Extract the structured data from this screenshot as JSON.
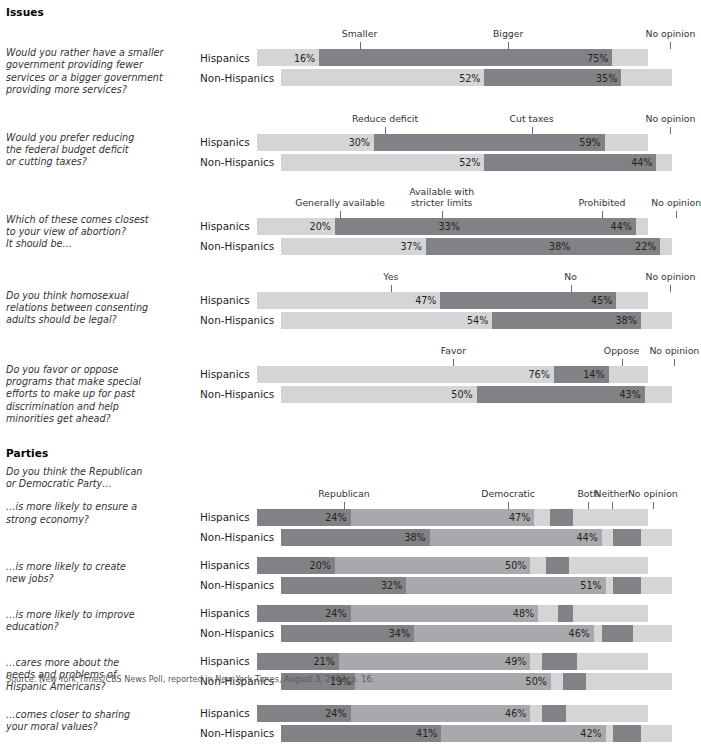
{
  "sections": [
    {
      "heading": "Issues",
      "questions": [
        {
          "id": "q-gov-size",
          "lines": [
            "Would you rather have a smaller",
            "government providing fewer",
            "services or a bigger government",
            "providing more services?"
          ],
          "categories": [
            {
              "label": "Smaller",
              "tick": 16.0
            },
            {
              "label": "Bigger",
              "tick": 54.0
            },
            {
              "label": "No opinion",
              "tick": 95.5
            }
          ],
          "rows": [
            {
              "label": "Hispanics",
              "segments": [
                {
                  "value": 16,
                  "shade": "light"
                },
                {
                  "value": 75,
                  "shade": "dark"
                },
                {
                  "value": 9,
                  "shade": "light",
                  "hide": true
                }
              ]
            },
            {
              "label": "Non-Hispanics",
              "segments": [
                {
                  "value": 52,
                  "shade": "light"
                },
                {
                  "value": 35,
                  "shade": "dark"
                },
                {
                  "value": 13,
                  "shade": "light",
                  "hide": true
                }
              ]
            }
          ]
        },
        {
          "id": "q-deficit-taxes",
          "lines": [
            "Would you prefer reducing",
            "the federal budget deficit",
            "or cutting taxes?"
          ],
          "categories": [
            {
              "label": "Reduce deficit",
              "tick": 22.5
            },
            {
              "label": "Cut taxes",
              "tick": 60.0
            },
            {
              "label": "No opinion",
              "tick": 95.5
            }
          ],
          "rows": [
            {
              "label": "Hispanics",
              "segments": [
                {
                  "value": 30,
                  "shade": "light"
                },
                {
                  "value": 59,
                  "shade": "dark"
                },
                {
                  "value": 11,
                  "shade": "light",
                  "hide": true
                }
              ]
            },
            {
              "label": "Non-Hispanics",
              "segments": [
                {
                  "value": 52,
                  "shade": "light"
                },
                {
                  "value": 44,
                  "shade": "dark"
                },
                {
                  "value": 4,
                  "shade": "light",
                  "hide": true
                }
              ]
            }
          ]
        },
        {
          "id": "q-abortion",
          "lines": [
            "Which of these comes closest",
            "to your view  of abortion?",
            "It should be…"
          ],
          "categories": [
            {
              "label": "Generally available",
              "tick": 11.0
            },
            {
              "label": "Available with\nstricter limits",
              "tick": 37.0,
              "two": true
            },
            {
              "label": "Prohibited",
              "tick": 78.0
            },
            {
              "label": "No opinion",
              "tick": 97.0
            }
          ],
          "rows": [
            {
              "label": "Hispanics",
              "segments": [
                {
                  "value": 20,
                  "shade": "light"
                },
                {
                  "value": 33,
                  "shade": "dark"
                },
                {
                  "value": 44,
                  "shade": "dark"
                },
                {
                  "value": 3,
                  "shade": "light",
                  "hide": true
                }
              ]
            },
            {
              "label": "Non-Hispanics",
              "segments": [
                {
                  "value": 37,
                  "shade": "light"
                },
                {
                  "value": 38,
                  "shade": "dark"
                },
                {
                  "value": 22,
                  "shade": "dark"
                },
                {
                  "value": 3,
                  "shade": "light",
                  "hide": true
                }
              ]
            }
          ]
        },
        {
          "id": "q-homosexual",
          "lines": [
            "Do you think homosexual",
            "relations between consenting",
            "adults should be legal?"
          ],
          "categories": [
            {
              "label": "Yes",
              "tick": 24.0
            },
            {
              "label": "No",
              "tick": 70.0
            },
            {
              "label": "No opinion",
              "tick": 95.5
            }
          ],
          "rows": [
            {
              "label": "Hispanics",
              "segments": [
                {
                  "value": 47,
                  "shade": "light"
                },
                {
                  "value": 45,
                  "shade": "dark"
                },
                {
                  "value": 8,
                  "shade": "light",
                  "hide": true
                }
              ]
            },
            {
              "label": "Non-Hispanics",
              "segments": [
                {
                  "value": 54,
                  "shade": "light"
                },
                {
                  "value": 38,
                  "shade": "dark"
                },
                {
                  "value": 8,
                  "shade": "light",
                  "hide": true
                }
              ]
            }
          ]
        },
        {
          "id": "q-affirmative-action",
          "lines": [
            "Do you favor or oppose",
            "programs that make special",
            "efforts to make up for past",
            "discrimination and help",
            "minorities get ahead?"
          ],
          "categories": [
            {
              "label": "Favor",
              "tick": 40.0
            },
            {
              "label": "Oppose",
              "tick": 83.0
            },
            {
              "label": "No opinion",
              "tick": 96.5
            }
          ],
          "rows": [
            {
              "label": "Hispanics",
              "segments": [
                {
                  "value": 76,
                  "shade": "light"
                },
                {
                  "value": 14,
                  "shade": "dark"
                },
                {
                  "value": 10,
                  "shade": "light",
                  "hide": true
                }
              ]
            },
            {
              "label": "Non-Hispanics",
              "segments": [
                {
                  "value": 50,
                  "shade": "light"
                },
                {
                  "value": 43,
                  "shade": "dark"
                },
                {
                  "value": 7,
                  "shade": "light",
                  "hide": true
                }
              ]
            }
          ]
        }
      ]
    },
    {
      "heading": "Parties",
      "intro": [
        "Do you think the Republican",
        "or Democratic Party…"
      ],
      "categories": [
        {
          "label": "Republican",
          "tick": 12.0
        },
        {
          "label": "Democratic",
          "tick": 54.0
        },
        {
          "label": "Both",
          "tick": 74.5
        },
        {
          "label": "Neither",
          "tick": 80.5
        },
        {
          "label": "No opinion",
          "tick": 91.0
        }
      ],
      "questions": [
        {
          "id": "q-strong-economy",
          "lines": [
            "…is more likely to ensure a",
            "strong economy?"
          ],
          "rows": [
            {
              "label": "Hispanics",
              "segments": [
                {
                  "value": 24,
                  "shade": "dark"
                },
                {
                  "value": 47,
                  "shade": "mid"
                },
                {
                  "value": 4,
                  "shade": "light",
                  "hide": true
                },
                {
                  "value": 6,
                  "shade": "dark",
                  "hide": true
                },
                {
                  "value": 19,
                  "shade": "light",
                  "hide": true
                }
              ]
            },
            {
              "label": "Non-Hispanics",
              "segments": [
                {
                  "value": 38,
                  "shade": "dark"
                },
                {
                  "value": 44,
                  "shade": "mid"
                },
                {
                  "value": 3,
                  "shade": "light",
                  "hide": true
                },
                {
                  "value": 7,
                  "shade": "dark",
                  "hide": true
                },
                {
                  "value": 8,
                  "shade": "light",
                  "hide": true
                }
              ]
            }
          ]
        },
        {
          "id": "q-create-jobs",
          "lines": [
            "…is more likely to create",
            "new jobs?"
          ],
          "rows": [
            {
              "label": "Hispanics",
              "segments": [
                {
                  "value": 20,
                  "shade": "dark"
                },
                {
                  "value": 50,
                  "shade": "mid"
                },
                {
                  "value": 4,
                  "shade": "light",
                  "hide": true
                },
                {
                  "value": 6,
                  "shade": "dark",
                  "hide": true
                },
                {
                  "value": 20,
                  "shade": "light",
                  "hide": true
                }
              ]
            },
            {
              "label": "Non-Hispanics",
              "segments": [
                {
                  "value": 32,
                  "shade": "dark"
                },
                {
                  "value": 51,
                  "shade": "mid"
                },
                {
                  "value": 2,
                  "shade": "light",
                  "hide": true
                },
                {
                  "value": 7,
                  "shade": "dark",
                  "hide": true
                },
                {
                  "value": 8,
                  "shade": "light",
                  "hide": true
                }
              ]
            }
          ]
        },
        {
          "id": "q-improve-education",
          "lines": [
            "…is more likely to improve",
            "education?"
          ],
          "rows": [
            {
              "label": "Hispanics",
              "segments": [
                {
                  "value": 24,
                  "shade": "dark"
                },
                {
                  "value": 48,
                  "shade": "mid"
                },
                {
                  "value": 5,
                  "shade": "light",
                  "hide": true
                },
                {
                  "value": 4,
                  "shade": "dark",
                  "hide": true
                },
                {
                  "value": 19,
                  "shade": "light",
                  "hide": true
                }
              ]
            },
            {
              "label": "Non-Hispanics",
              "segments": [
                {
                  "value": 34,
                  "shade": "dark"
                },
                {
                  "value": 46,
                  "shade": "mid"
                },
                {
                  "value": 2,
                  "shade": "light",
                  "hide": true
                },
                {
                  "value": 8,
                  "shade": "dark",
                  "hide": true
                },
                {
                  "value": 10,
                  "shade": "light",
                  "hide": true
                }
              ]
            }
          ]
        },
        {
          "id": "q-hispanic-needs",
          "lines": [
            "…cares more about the",
            "needs and problems of",
            "Hispanic Americans?"
          ],
          "rows": [
            {
              "label": "Hispanics",
              "segments": [
                {
                  "value": 21,
                  "shade": "dark"
                },
                {
                  "value": 49,
                  "shade": "mid"
                },
                {
                  "value": 3,
                  "shade": "light",
                  "hide": true
                },
                {
                  "value": 9,
                  "shade": "dark",
                  "hide": true
                },
                {
                  "value": 18,
                  "shade": "light",
                  "hide": true
                }
              ]
            },
            {
              "label": "Non-Hispanics",
              "segments": [
                {
                  "value": 19,
                  "shade": "dark"
                },
                {
                  "value": 50,
                  "shade": "mid"
                },
                {
                  "value": 3,
                  "shade": "light",
                  "hide": true
                },
                {
                  "value": 6,
                  "shade": "dark",
                  "hide": true
                },
                {
                  "value": 22,
                  "shade": "light",
                  "hide": true
                }
              ]
            }
          ]
        },
        {
          "id": "q-moral-values",
          "lines": [
            "…comes closer to sharing",
            "your moral values?"
          ],
          "rows": [
            {
              "label": "Hispanics",
              "segments": [
                {
                  "value": 24,
                  "shade": "dark"
                },
                {
                  "value": 46,
                  "shade": "mid"
                },
                {
                  "value": 3,
                  "shade": "light",
                  "hide": true
                },
                {
                  "value": 6,
                  "shade": "dark",
                  "hide": true
                },
                {
                  "value": 21,
                  "shade": "light",
                  "hide": true
                }
              ]
            },
            {
              "label": "Non-Hispanics",
              "segments": [
                {
                  "value": 41,
                  "shade": "dark"
                },
                {
                  "value": 42,
                  "shade": "mid"
                },
                {
                  "value": 2,
                  "shade": "light",
                  "hide": true
                },
                {
                  "value": 7,
                  "shade": "dark",
                  "hide": true
                },
                {
                  "value": 8,
                  "shade": "light",
                  "hide": true
                }
              ]
            }
          ]
        }
      ]
    }
  ],
  "footer": "Source: New York Times/CBS News Poll, reported in New York Times, August 3, 2003, p. 16.",
  "colors": {
    "light": "#d4d5d6",
    "mid": "#a7a9ac",
    "dark": "#808285",
    "tick": "#6d6e71",
    "text": "#231f20"
  }
}
